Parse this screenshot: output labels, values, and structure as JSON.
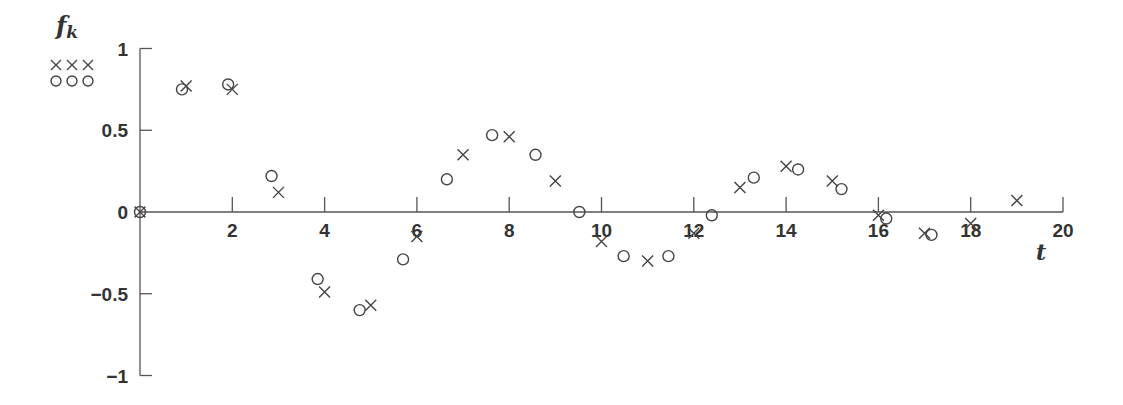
{
  "chart_data": {
    "type": "scatter",
    "title": "",
    "xlabel": "t",
    "ylabel": "f_k",
    "ylabel_main": "f",
    "ylabel_sub": "k",
    "xlim": [
      0,
      20
    ],
    "ylim": [
      -1,
      1
    ],
    "x_ticks": [
      2,
      4,
      6,
      8,
      10,
      12,
      14,
      16,
      18,
      20
    ],
    "x_tick_labels": [
      "2",
      "4",
      "6",
      "8",
      "10",
      "12",
      "14",
      "16",
      "18",
      "20"
    ],
    "y_ticks": [
      1,
      0.5,
      0,
      -0.5,
      -1
    ],
    "y_tick_labels": [
      "1",
      "0.5",
      "0",
      "−0.5",
      "−1"
    ],
    "grid": false,
    "legend": {
      "position": "top-left",
      "entries": [
        {
          "marker": "x",
          "symbol": "×××"
        },
        {
          "marker": "o",
          "symbol": "○○○"
        }
      ]
    },
    "series": [
      {
        "name": "×××",
        "marker": "x",
        "x": [
          0,
          1,
          2,
          3,
          4,
          5,
          6,
          7,
          8,
          9,
          10,
          11,
          12,
          13,
          14,
          15,
          16,
          17,
          18,
          19
        ],
        "y": [
          0,
          0.77,
          0.75,
          0.12,
          -0.49,
          -0.57,
          -0.15,
          0.35,
          0.46,
          0.19,
          -0.18,
          -0.3,
          -0.13,
          0.15,
          0.28,
          0.19,
          -0.02,
          -0.13,
          -0.07,
          0.07
        ]
      },
      {
        "name": "○○○",
        "marker": "o",
        "x": [
          0,
          0.91,
          1.91,
          2.85,
          3.85,
          4.76,
          5.7,
          6.65,
          7.63,
          8.57,
          9.52,
          10.48,
          11.45,
          12.39,
          13.3,
          14.26,
          15.2,
          16.17,
          17.15
        ],
        "y": [
          0,
          0.75,
          0.78,
          0.22,
          -0.41,
          -0.6,
          -0.29,
          0.2,
          0.47,
          0.35,
          0.0,
          -0.27,
          -0.27,
          -0.02,
          0.21,
          0.26,
          0.14,
          -0.04,
          -0.14
        ]
      }
    ]
  }
}
